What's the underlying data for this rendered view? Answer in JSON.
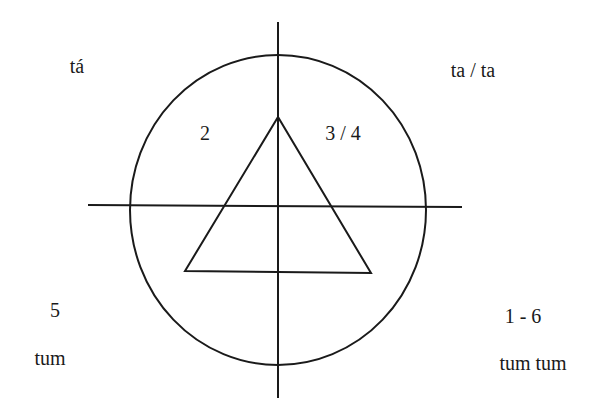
{
  "diagram": {
    "type": "rhythm-circle",
    "colors": {
      "line": "#1a1a1a",
      "background": "#ffffff"
    },
    "shapes": {
      "circle": {
        "cx": 278,
        "cy": 210,
        "rx": 148,
        "ry": 155
      },
      "vertical_axis": {
        "x": 278,
        "y1": 22,
        "y2": 398
      },
      "horizontal_axis": {
        "y": 205,
        "x1": 88,
        "x2": 462
      },
      "triangle": {
        "points": [
          [
            278,
            117
          ],
          [
            185,
            271
          ],
          [
            371,
            273
          ]
        ]
      }
    },
    "labels": {
      "top_left_syllable": "tá",
      "top_right_syllable": "ta / ta",
      "inner_top_left_count": "2",
      "inner_top_right_count": "3 / 4",
      "bottom_left_count": "5",
      "bottom_left_syllable": "tum",
      "bottom_right_count": "1 - 6",
      "bottom_right_syllable": "tum tum"
    }
  }
}
